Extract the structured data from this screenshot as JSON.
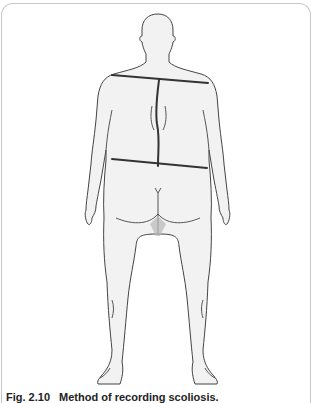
{
  "figure": {
    "label": "Fig. 2.10",
    "title": "Method of recording scoliosis.",
    "annotations": [
      {
        "name": "shoulder-line",
        "description": "line through both shoulders"
      },
      {
        "name": "spine-curve",
        "description": "curved line along spine"
      },
      {
        "name": "pelvic-line",
        "description": "line through iliac crests"
      }
    ]
  },
  "colors": {
    "outline": "#444444",
    "body_fill": "#f2f2f2",
    "annotation": "#333333",
    "frame": "#c8c8c8"
  }
}
